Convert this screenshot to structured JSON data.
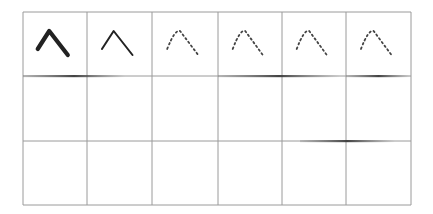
{
  "grid": {
    "columns": 6,
    "rows": 3,
    "x_lines": [
      23,
      87,
      152,
      218,
      282,
      346,
      411
    ],
    "y_lines": [
      12,
      76,
      141,
      205
    ],
    "line_color": "#9a9a9a",
    "stroke_color": "#222222"
  },
  "cells": [
    {
      "col": 0,
      "row": 0,
      "shape": "caret-up-stroke",
      "style": "thick-solid"
    },
    {
      "col": 1,
      "row": 0,
      "shape": "caret-up-stroke",
      "style": "thin-solid"
    },
    {
      "col": 2,
      "row": 0,
      "shape": "caret-up-stroke",
      "style": "dotted"
    },
    {
      "col": 3,
      "row": 0,
      "shape": "caret-up-stroke",
      "style": "dotted"
    },
    {
      "col": 4,
      "row": 0,
      "shape": "caret-up-stroke",
      "style": "dotted"
    },
    {
      "col": 5,
      "row": 0,
      "shape": "caret-up-stroke",
      "style": "dotted"
    }
  ],
  "smudges": [
    {
      "x1": 23,
      "x2": 125,
      "y": 76
    },
    {
      "x1": 218,
      "x2": 340,
      "y": 76
    },
    {
      "x1": 346,
      "x2": 411,
      "y": 76
    },
    {
      "x1": 300,
      "x2": 395,
      "y": 141
    }
  ]
}
